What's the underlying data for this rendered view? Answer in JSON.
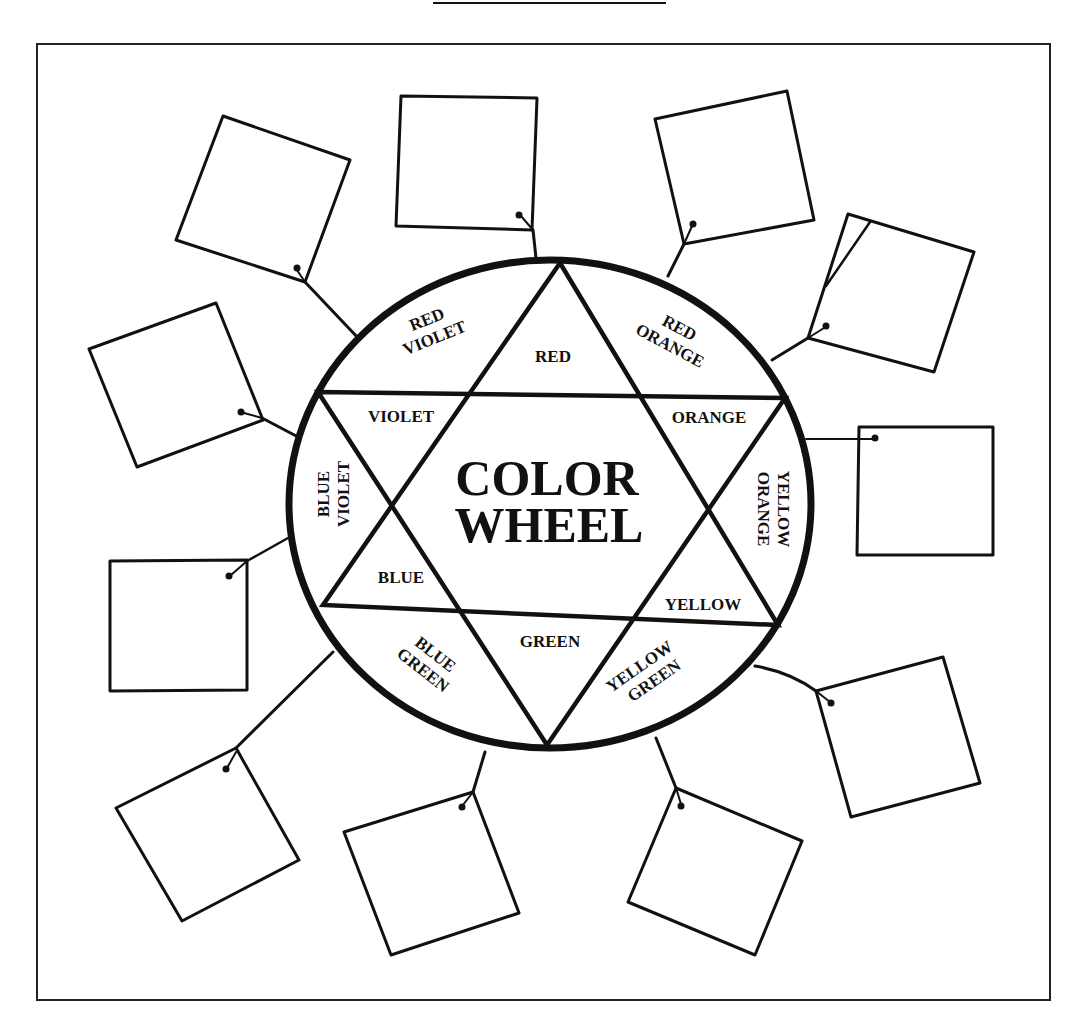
{
  "worksheet": {
    "title_rule": true,
    "frame": {
      "x": 37,
      "y": 44,
      "width": 1013,
      "height": 956
    }
  },
  "wheel": {
    "center_title_line1": "COLOR",
    "center_title_line2": "WHEEL",
    "center": {
      "cx": 550,
      "cy": 504,
      "rx": 262,
      "ry": 244
    },
    "segments": {
      "red": "RED",
      "red_orange_1": "RED",
      "red_orange_2": "ORANGE",
      "orange": "ORANGE",
      "yellow_orange_1": "YELLOW",
      "yellow_orange_2": "ORANGE",
      "yellow": "YELLOW",
      "yellow_green_1": "YELLOW",
      "yellow_green_2": "GREEN",
      "green": "GREEN",
      "blue_green_1": "BLUE",
      "blue_green_2": "GREEN",
      "blue": "BLUE",
      "blue_violet_1": "BLUE",
      "blue_violet_2": "VIOLET",
      "violet": "VIOLET",
      "red_violet_1": "RED",
      "red_violet_2": "VIOLET"
    }
  },
  "answer_boxes": {
    "count": 12,
    "filled": false
  },
  "colors": {
    "ink": "#111111",
    "paper": "#ffffff"
  }
}
